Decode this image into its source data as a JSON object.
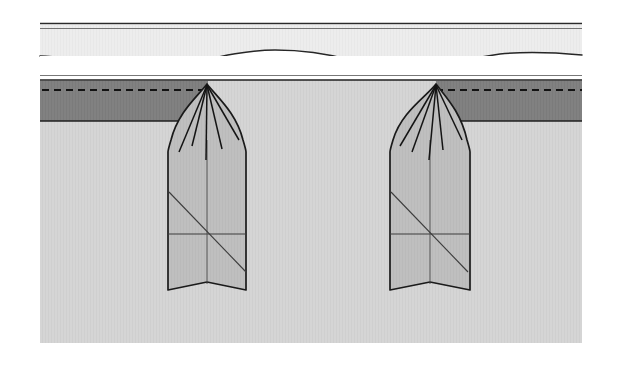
{
  "figure": {
    "kind": "geotechnical-cross-section",
    "canvas": {
      "width": 624,
      "height": 366,
      "background": "#ffffff"
    },
    "drawing_area": {
      "x": 38,
      "y": 22,
      "width": 548,
      "height": 321
    }
  },
  "colors": {
    "background": "#ffffff",
    "upper_layer_fill": "#eeeeee",
    "water_gap_fill": "#ffffff",
    "dark_layer_fill": "#808080",
    "lower_soil_fill": "#d5d5d5",
    "pile_fill": "#bdbdbd",
    "line_stroke": "#1a1a1a",
    "hairline_stroke": "#3c3c3c"
  },
  "layers": [
    {
      "name": "upper-band",
      "label": "upper band",
      "fill": "#eeeeee",
      "top_y": 22,
      "bottom_y": 30,
      "note": "thin light band bounded above and below by hairlines"
    },
    {
      "name": "seabed-undulating-band",
      "label": "undulating surface band",
      "fill": "#eeeeee",
      "top_y": 30,
      "bottom_y": 56,
      "note": "band whose lower boundary is a wavy undulating curve"
    },
    {
      "name": "water-gap",
      "label": "open white gap",
      "fill": "#ffffff",
      "top_y": 56,
      "bottom_y": 74
    },
    {
      "name": "ground-surface-line",
      "label": "ground surface",
      "y": 77,
      "note": "double hairline marking the top of the soil block"
    },
    {
      "name": "dark-stratum",
      "label": "dark stratum",
      "fill": "#808080",
      "top_y": 80,
      "bottom_y": 121,
      "note": "darker soil layer interrupted by the two piles"
    },
    {
      "name": "lower-soil",
      "label": "lower soil mass",
      "fill": "#d5d5d5",
      "top_y": 121,
      "bottom_y": 343
    }
  ],
  "dashed_lines": [
    {
      "name": "left-dashed-level",
      "y": 90,
      "x_start": 42,
      "x_end": 207,
      "dash": "7 5",
      "note": "dashed level line running from left edge to the left pile apex"
    },
    {
      "name": "right-dashed-level",
      "y": 90,
      "x_start": 436,
      "x_end": 582,
      "dash": "7 5",
      "note": "dashed level line running from the right pile apex to the right edge"
    }
  ],
  "undulating_curve": {
    "name": "wavy-surface-profile",
    "path_points": "45,56 80,60 110,66 140,70 165,68 190,62 220,56 250,52 275,50 300,51 325,55 352,61 380,67 408,69 432,66 460,60 490,55 520,52 548,52 575,54 582,55",
    "note": "smooth undulating profile curve spanning the figure width"
  },
  "piles": [
    {
      "name": "left-pile",
      "label": "left pile",
      "apex": {
        "x": 207,
        "y": 84
      },
      "tip_y": 298,
      "left_x": 168,
      "right_x": 246,
      "shoulder_y": 152,
      "notch_depth": 12,
      "mid_line_y": 234,
      "diagonal": "from top-left of body to bottom-right of body",
      "center_x": 207,
      "radiating_lines": 5,
      "orientation": "dark stratum lies to the LEFT of this pile apex"
    },
    {
      "name": "right-pile",
      "label": "right pile",
      "apex": {
        "x": 436,
        "y": 84
      },
      "tip_y": 298,
      "left_x": 390,
      "right_x": 470,
      "shoulder_y": 152,
      "notch_depth": 12,
      "mid_line_y": 234,
      "diagonal": "from top-left of body to bottom-right of body",
      "center_x": 430,
      "radiating_lines": 5,
      "orientation": "dark stratum lies to the RIGHT of this pile apex"
    }
  ],
  "radiating_fan": {
    "name": "apex-fan-lines",
    "count": 5,
    "note": "five straight lines fanning downward from each pile apex into the pile body"
  }
}
